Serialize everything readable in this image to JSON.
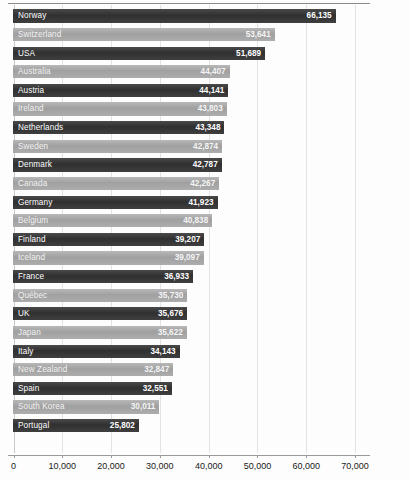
{
  "chart_data": {
    "type": "bar",
    "orientation": "horizontal",
    "title": "",
    "xlabel": "",
    "ylabel": "",
    "xlim": [
      0,
      75000
    ],
    "grid": true,
    "legend": "none",
    "xticks": [
      "0",
      "10,000",
      "20,000",
      "30,000",
      "40,000",
      "50,000",
      "60,000",
      "70,000"
    ],
    "xtick_values": [
      0,
      10000,
      20000,
      30000,
      40000,
      50000,
      60000,
      70000
    ],
    "categories": [
      "Norway",
      "Switzerland",
      "USA",
      "Australia",
      "Austria",
      "Ireland",
      "Netherlands",
      "Sweden",
      "Denmark",
      "Canada",
      "Germany",
      "Belgium",
      "Finland",
      "Iceland",
      "France",
      "Québec",
      "UK",
      "Japan",
      "Italy",
      "New Zealand",
      "Spain",
      "South Korea",
      "Portugal"
    ],
    "values": [
      66135,
      53641,
      51689,
      44407,
      44141,
      43803,
      43348,
      42874,
      42787,
      42267,
      41923,
      40838,
      39207,
      39097,
      36933,
      35730,
      35676,
      35622,
      34143,
      32847,
      32551,
      30011,
      25802
    ],
    "value_labels": [
      "66,135",
      "53,641",
      "51,689",
      "44,407",
      "44,141",
      "43,803",
      "43,348",
      "42,874",
      "42,787",
      "42,267",
      "41,923",
      "40,838",
      "39,207",
      "39,097",
      "36,933",
      "35,730",
      "35,676",
      "35,622",
      "34,143",
      "32,847",
      "32,551",
      "30,011",
      "25,802"
    ],
    "bar_styles": [
      "dark",
      "light",
      "dark",
      "light",
      "dark",
      "light",
      "dark",
      "light",
      "dark",
      "light",
      "dark",
      "light",
      "dark",
      "light",
      "dark",
      "light",
      "dark",
      "light",
      "dark",
      "light",
      "dark",
      "light",
      "dark"
    ],
    "colors": {
      "bar_dark": "#353535",
      "bar_light": "#a8a8a8",
      "gridline": "#e3e3e3",
      "axis": "#9a9a9a",
      "value_text": "#ffffff",
      "tick_text": "#1a1a1a",
      "background": "#fdfdfd"
    }
  }
}
